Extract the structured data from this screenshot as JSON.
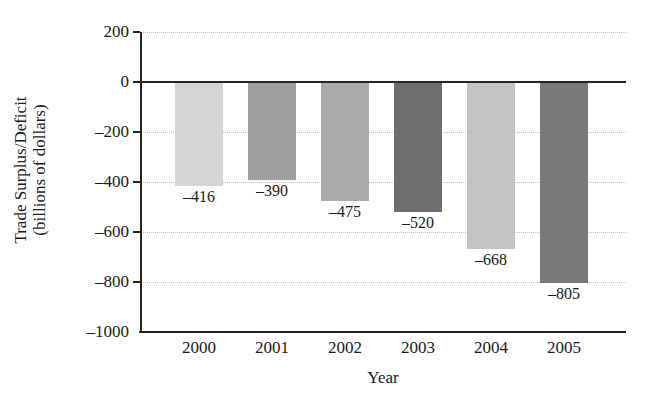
{
  "chart_data": {
    "type": "bar",
    "title": "",
    "subtitle": "",
    "xlabel": "Year",
    "ylabel": "Trade Surplus/Deficit (billions of dollars)",
    "ylabel_line1": "Trade Surplus/Deficit",
    "ylabel_line2": "(billions of dollars)",
    "categories": [
      "2000",
      "2001",
      "2002",
      "2003",
      "2004",
      "2005"
    ],
    "values": [
      -416,
      -390,
      -475,
      -520,
      -668,
      -805
    ],
    "data_labels": [
      "–416",
      "–390",
      "–475",
      "–520",
      "–668",
      "–805"
    ],
    "bar_colors": [
      "#d5d5d5",
      "#9e9e9e",
      "#ababab",
      "#6e6e6e",
      "#c3c3c3",
      "#797979"
    ],
    "ylim": [
      -1000,
      200
    ],
    "ytick_values": [
      200,
      0,
      -200,
      -400,
      -600,
      -800,
      -1000
    ],
    "ytick_labels": [
      "200",
      "0",
      "–200",
      "–400",
      "–600",
      "–800",
      "–1000"
    ],
    "grid": true,
    "grid_style": "dotted",
    "grid_color": "#bdbdbd",
    "legend": false,
    "axis_color": "#242424",
    "background": "#ffffff"
  }
}
